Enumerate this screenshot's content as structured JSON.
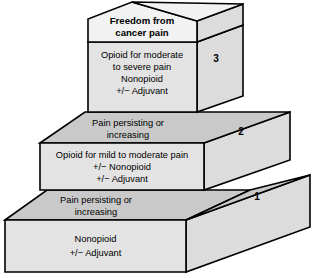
{
  "figure": {
    "name": "WHO three-step analgesic ladder",
    "background_color": "#ffffff",
    "colors": {
      "front_face": "#e3e3e3",
      "top_face": "#c9c9c9",
      "side_face": "#dcdcdc",
      "cap_face": "#f2f2f2",
      "outline": "#000000",
      "text": "#000000"
    }
  },
  "goal": {
    "line1": "Freedom from",
    "line2": "cancer pain"
  },
  "steps": [
    {
      "number": "1",
      "lines": [
        "Nonopioid",
        "+/− Adjuvant"
      ]
    },
    {
      "number": "2",
      "lines": [
        "Opioid for mild to moderate pain",
        "+/− Nonopioid",
        "+/− Adjuvant"
      ]
    },
    {
      "number": "3",
      "lines": [
        "Opioid for moderate",
        "to severe pain",
        "Nonopioid",
        "+/− Adjuvant"
      ]
    }
  ],
  "transitions": [
    {
      "id": "step1-to-step2",
      "line1": "Pain persisting or",
      "line2": "increasing"
    },
    {
      "id": "step2-to-step3",
      "line1": "Pain persisting or",
      "line2": "increasing"
    }
  ]
}
